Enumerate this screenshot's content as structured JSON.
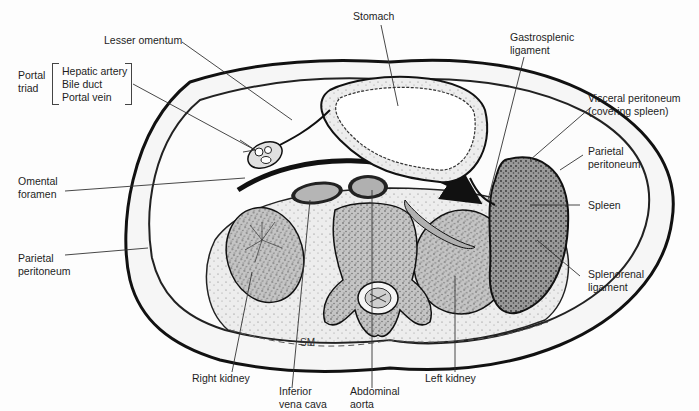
{
  "figure": {
    "signature": "SM"
  },
  "labels": {
    "stomach": "Stomach",
    "lesser_omentum": "Lesser omentum",
    "portal_triad": {
      "title_line1": "Portal",
      "title_line2": "triad",
      "items": [
        "Hepatic artery",
        "Bile duct",
        "Portal vein"
      ]
    },
    "gastrosplenic": {
      "line1": "Gastrosplenic",
      "line2": "ligament"
    },
    "visceral_peritoneum": {
      "line1": "Visceral peritoneum",
      "line2": "(covering spleen)"
    },
    "parietal_peritoneum_right": {
      "line1": "Parietal",
      "line2": "peritoneum"
    },
    "omental_foramen": {
      "line1": "Omental",
      "line2": "foramen"
    },
    "parietal_peritoneum_left": {
      "line1": "Parietal",
      "line2": "peritoneum"
    },
    "spleen": "Spleen",
    "splenorenal": {
      "line1": "Splenorenal",
      "line2": "ligament"
    },
    "right_kidney": "Right kidney",
    "inferior_vena_cava": {
      "line1": "Inferior",
      "line2": "vena cava"
    },
    "abdominal_aorta": {
      "line1": "Abdominal",
      "line2": "aorta"
    },
    "left_kidney": "Left kidney"
  },
  "colors": {
    "outline": "#111111",
    "organ_fill": "#b9b9b9",
    "vessel_fill": "#a8a8a8",
    "wall_fill": "#f4f4f4",
    "leader": "#333333"
  }
}
